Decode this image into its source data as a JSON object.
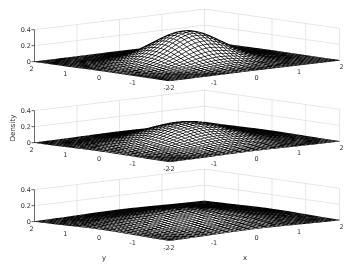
{
  "figure": {
    "background": "#ffffff",
    "mesh_face_color": "#ffffff",
    "mesh_edge_color": "#000000",
    "wall_grid_color": "#dedede",
    "axis_line_color": "#4d4d4d",
    "tick_text_color": "#333333"
  },
  "chart_data": {
    "type": "surface",
    "title": "",
    "x_range": [
      -2,
      2
    ],
    "y_range": [
      -2,
      2
    ],
    "z_range": [
      0,
      0.4
    ],
    "grid_points": 41,
    "view": {
      "azimuth_deg": -37.5,
      "elevation_deg": 30
    },
    "xticks": [
      "-2",
      "-1",
      "0",
      "1",
      "2"
    ],
    "yticks": [
      "2",
      "1",
      "0",
      "-1",
      "-2"
    ],
    "zticks": [
      "0",
      "0.2",
      "0.4"
    ],
    "subplots": [
      {
        "sigma": 0.65,
        "peak_density": 0.377,
        "zlabel": "",
        "xlabel": "",
        "ylabel": ""
      },
      {
        "sigma": 0.8,
        "peak_density": 0.249,
        "zlabel": "Density",
        "xlabel": "",
        "ylabel": ""
      },
      {
        "sigma": 1.0,
        "peak_density": 0.159,
        "zlabel": "",
        "xlabel": "x",
        "ylabel": "y"
      }
    ]
  }
}
